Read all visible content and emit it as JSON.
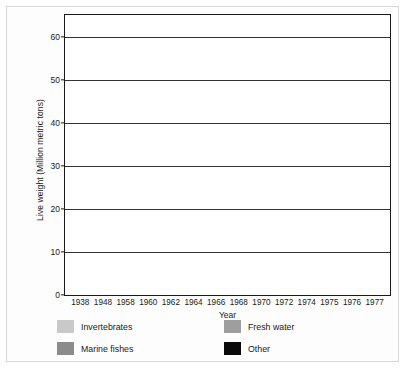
{
  "chart_data": {
    "type": "bar",
    "subtype": "stacked-vertical",
    "title": "",
    "xlabel": "Year",
    "ylabel": "Live weight (Million metric tons)",
    "categories": [
      "1938",
      "1948",
      "1958",
      "1960",
      "1962",
      "1964",
      "1966",
      "1968",
      "1970",
      "1972",
      "1974",
      "1975",
      "1976",
      "1977"
    ],
    "ylim": [
      0,
      65
    ],
    "yticks": [
      0,
      10,
      20,
      30,
      40,
      50,
      60
    ],
    "ytick_labels": [
      "0",
      "10",
      "20",
      "30",
      "40",
      "50",
      "60"
    ],
    "grid": true,
    "legend_position": "below-axes",
    "series": [
      {
        "name": "Other",
        "color": "#0a0a0a",
        "values": [
          0.8,
          0.6,
          0.9,
          0.9,
          1.0,
          1.0,
          1.0,
          1.1,
          1.1,
          1.1,
          1.1,
          1.1,
          1.2,
          1.2
        ]
      },
      {
        "name": "Fresh water",
        "color": "#9e9e9e",
        "values": [
          2.2,
          2.2,
          3.1,
          3.1,
          3.3,
          3.5,
          3.7,
          4.0,
          4.2,
          4.4,
          4.7,
          4.8,
          5.2,
          5.6
        ]
      },
      {
        "name": "Marine fishes",
        "color": "#8b8b8b",
        "values": [
          15.7,
          14.2,
          23.0,
          23.8,
          26.6,
          29.4,
          32.2,
          35.9,
          37.0,
          40.4,
          38.7,
          38.4,
          46.4,
          49.8
        ]
      },
      {
        "name": "Invertebrates",
        "color": "#c9c9c9",
        "values": [
          3.3,
          2.0,
          4.5,
          4.7,
          5.4,
          6.1,
          6.8,
          6.5,
          6.6,
          7.1,
          9.3,
          10.3,
          8.4,
          7.6
        ]
      }
    ],
    "totals": [
      22.0,
      19.0,
      31.5,
      32.5,
      36.3,
      40.0,
      43.7,
      47.5,
      48.9,
      53.0,
      53.8,
      54.6,
      61.2,
      64.2
    ],
    "stack_order_bottom_to_top": [
      "Other",
      "Fresh water",
      "Marine fishes",
      "Invertebrates"
    ]
  },
  "legend": {
    "items": [
      {
        "label": "Invertebrates",
        "color": "#c9c9c9"
      },
      {
        "label": "Fresh water",
        "color": "#9e9e9e"
      },
      {
        "label": "Marine fishes",
        "color": "#8b8b8b"
      },
      {
        "label": "Other",
        "color": "#0a0a0a"
      }
    ]
  }
}
